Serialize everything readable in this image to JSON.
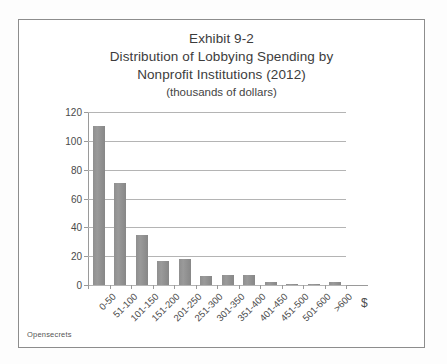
{
  "figure": {
    "source_note": "Opensecrets",
    "dollar_axis_symbol": "$",
    "frame_color": "#8d8d8d",
    "bar_color": "#8f8f8f",
    "grid_color": "#b4b4b4"
  },
  "chart_data": {
    "type": "bar",
    "title": "Exhibit 9-2",
    "title_lines": [
      "Exhibit 9-2",
      "Distribution of Lobbying Spending by",
      "Nonprofit Institutions (2012)"
    ],
    "subtitle": "(thousands of dollars)",
    "xlabel": "$",
    "ylabel": "Number of Organizations",
    "categories": [
      "0-50",
      "51-100",
      "101-150",
      "151-200",
      "201-250",
      "251-300",
      "301-350",
      "351-400",
      "401-450",
      "451-500",
      "501-600",
      ">600"
    ],
    "values": [
      110,
      71,
      35,
      17,
      18,
      6,
      7,
      7,
      2,
      1,
      1,
      2
    ],
    "ylim": [
      0,
      120
    ],
    "yticks": [
      0,
      20,
      40,
      60,
      80,
      100,
      120
    ],
    "ytick_labels": [
      "0",
      "20",
      "40",
      "60",
      "80",
      "100",
      "120"
    ],
    "grid": "horizontal",
    "legend": "none"
  }
}
